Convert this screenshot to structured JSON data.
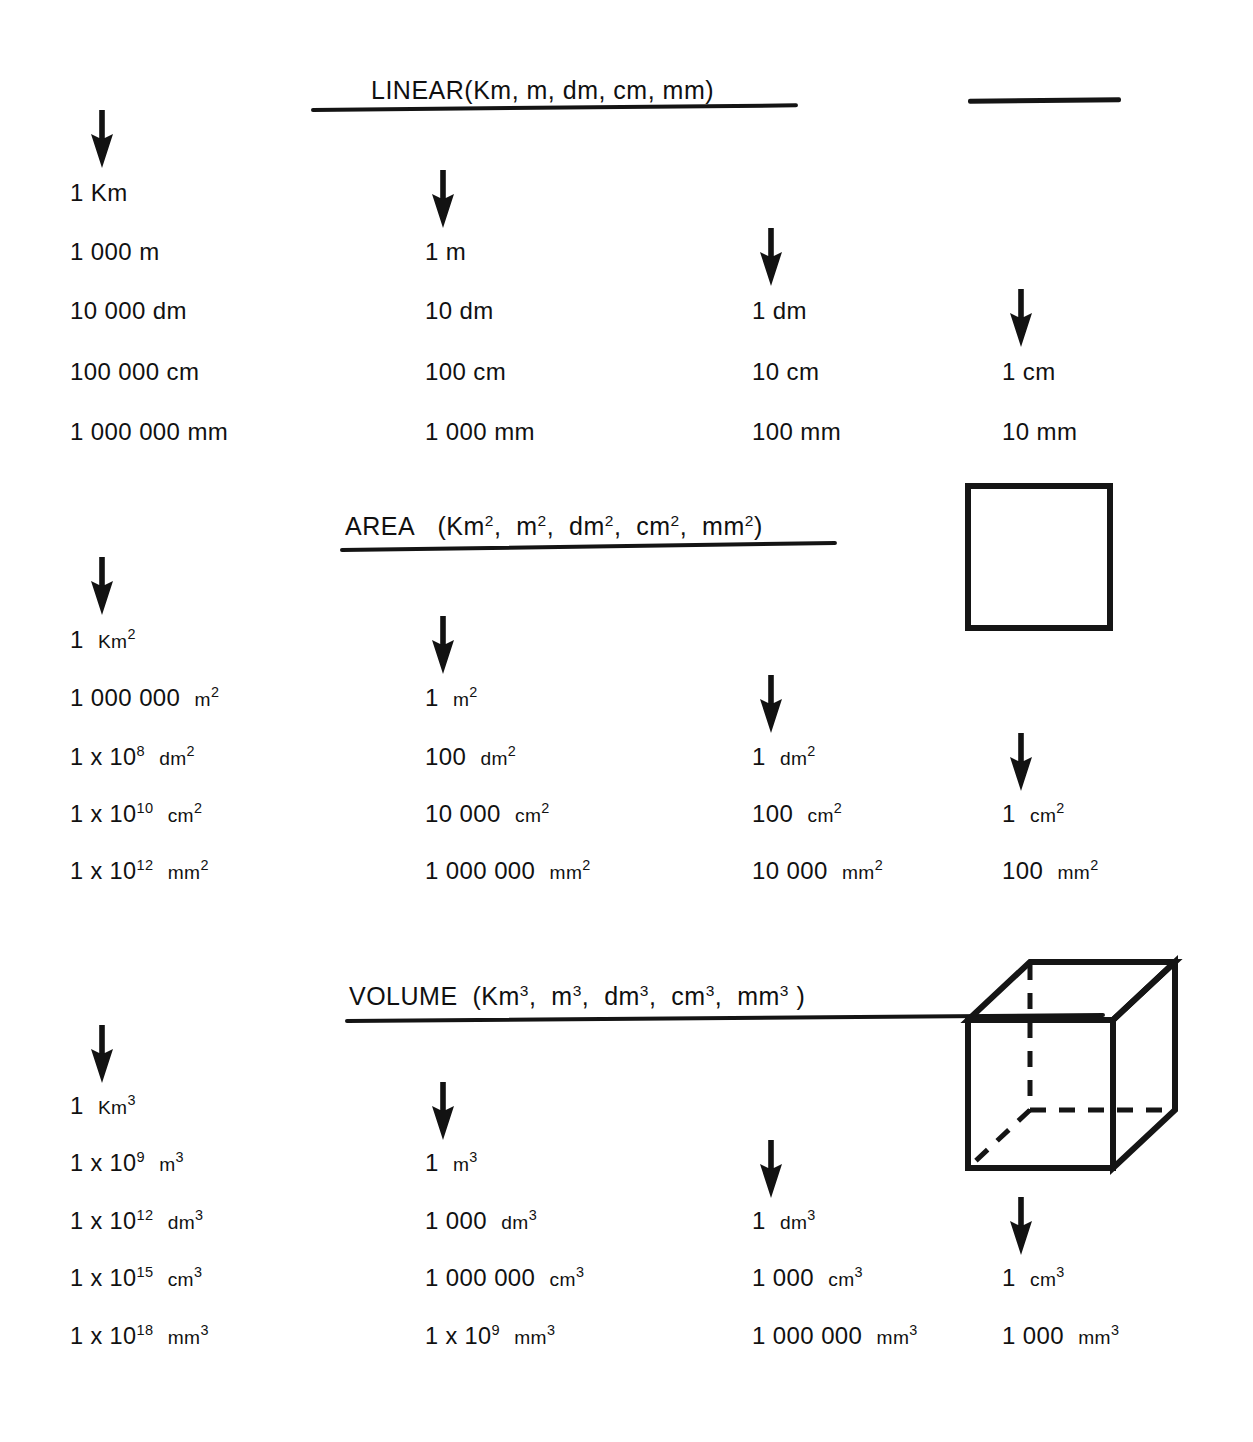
{
  "document": {
    "title": "Metric Units Conversion Chart",
    "background": "#ffffff",
    "ink": "#111111"
  },
  "sections": [
    {
      "id": "linear",
      "name": "LINEAR",
      "units_list": "(Km,  m,  dm,  cm,  mm)",
      "title_full": "LINEAR (Km, m, dm, cm, mm)",
      "figure": "line-segment",
      "columns": [
        {
          "base": "1 Km",
          "rows": [
            "1 Km",
            "1 000 m",
            "10 000 dm",
            "100 000 cm",
            "1 000 000 mm"
          ]
        },
        {
          "base": "1 m",
          "rows": [
            "1 m",
            "10 dm",
            "100 cm",
            "1 000 mm"
          ]
        },
        {
          "base": "1 dm",
          "rows": [
            "1 dm",
            "10 cm",
            "100 mm"
          ]
        },
        {
          "base": "1 cm",
          "rows": [
            "1 cm",
            "10 mm"
          ]
        }
      ]
    },
    {
      "id": "area",
      "name": "AREA",
      "units_list": "(Km2,  m2,  dm2,  cm2,  mm2)",
      "title_full": "AREA (Km², m², dm², cm², mm²)",
      "figure": "square",
      "columns": [
        {
          "base": "1 Km2",
          "rows": [
            "1 Km2",
            "1 000 000 m2",
            "1 x 108 dm2",
            "1 x 1010 cm2",
            "1 x 1012 mm2"
          ]
        },
        {
          "base": "1 m2",
          "rows": [
            "1 m2",
            "100 dm2",
            "10 000 cm2",
            "1 000 000 mm2"
          ]
        },
        {
          "base": "1 dm2",
          "rows": [
            "1 dm2",
            "100 cm2",
            "10 000 mm2"
          ]
        },
        {
          "base": "1 cm2",
          "rows": [
            "1 cm2",
            "100 mm2"
          ]
        }
      ]
    },
    {
      "id": "volume",
      "name": "VOLUME",
      "units_list": "(Km3,  m3,  dm3,  cm3,  mm3 )",
      "title_full": "VOLUME (Km³, m³, dm³, cm³, mm³ )",
      "figure": "cube",
      "columns": [
        {
          "base": "1 Km3",
          "rows": [
            "1 Km3",
            "1 x 109 m3",
            "1 x 1012 dm3",
            "1 x 1015 cm3",
            "1 x 1018 mm3"
          ]
        },
        {
          "base": "1 m3",
          "rows": [
            "1 m3",
            "1 000 dm3",
            "1 000 000 cm3",
            "1 x 109 mm3"
          ]
        },
        {
          "base": "1 dm3",
          "rows": [
            "1 dm3",
            "1 000 cm3",
            "1 000 000 mm3"
          ]
        },
        {
          "base": "1 cm3",
          "rows": [
            "1 cm3",
            "1 000 mm3"
          ]
        }
      ]
    }
  ],
  "linear": {
    "title_name": "LINEAR",
    "title_units": "(Km,  m,  dm,  cm,  mm)",
    "c1": {
      "r1": "1  Km",
      "r2": "1  000  m",
      "r3": "10  000  dm",
      "r4": "100  000  cm",
      "r5": "1  000  000  mm"
    },
    "c2": {
      "r1": "1  m",
      "r2": "10  dm",
      "r3": "100  cm",
      "r4": "1  000  mm"
    },
    "c3": {
      "r1": "1  dm",
      "r2": "10  cm",
      "r3": "100  mm"
    },
    "c4": {
      "r1": "1  cm",
      "r2": "10  mm"
    }
  },
  "area": {
    "title_name": "AREA",
    "c1": {
      "r1_num": "1",
      "r1_unit": "Km",
      "r1_exp": "2",
      "r2_num": "1  000  000",
      "r2_unit": "m",
      "r2_exp": "2",
      "r3_coef": "1  x  10",
      "r3_pow": "8",
      "r3_unit": "dm",
      "r3_exp": "2",
      "r4_coef": "1  x  10",
      "r4_pow": "10",
      "r4_unit": "cm",
      "r4_exp": "2",
      "r5_coef": "1  x  10",
      "r5_pow": "12",
      "r5_unit": "mm",
      "r5_exp": "2"
    },
    "c2": {
      "r1_num": "1",
      "r1_unit": "m",
      "r1_exp": "2",
      "r2_num": "100",
      "r2_unit": "dm",
      "r2_exp": "2",
      "r3_num": "10  000",
      "r3_unit": "cm",
      "r3_exp": "2",
      "r4_num": "1  000  000",
      "r4_unit": "mm",
      "r4_exp": "2"
    },
    "c3": {
      "r1_num": "1",
      "r1_unit": "dm",
      "r1_exp": "2",
      "r2_num": "100",
      "r2_unit": "cm",
      "r2_exp": "2",
      "r3_num": "10  000",
      "r3_unit": "mm",
      "r3_exp": "2"
    },
    "c4": {
      "r1_num": "1",
      "r1_unit": "cm",
      "r1_exp": "2",
      "r2_num": "100",
      "r2_unit": "mm",
      "r2_exp": "2"
    }
  },
  "volume": {
    "title_name": "VOLUME",
    "c1": {
      "r1_num": "1",
      "r1_unit": "Km",
      "r1_exp": "3",
      "r2_coef": "1  x  10",
      "r2_pow": "9",
      "r2_unit": "m",
      "r2_exp": "3",
      "r3_coef": "1  x  10",
      "r3_pow": "12",
      "r3_unit": "dm",
      "r3_exp": "3",
      "r4_coef": "1  x  10",
      "r4_pow": "15",
      "r4_unit": "cm",
      "r4_exp": "3",
      "r5_coef": "1  x  10",
      "r5_pow": "18",
      "r5_unit": "mm",
      "r5_exp": "3"
    },
    "c2": {
      "r1_num": "1",
      "r1_unit": "m",
      "r1_exp": "3",
      "r2_num": "1  000",
      "r2_unit": "dm",
      "r2_exp": "3",
      "r3_num": "1  000  000",
      "r3_unit": "cm",
      "r3_exp": "3",
      "r4_coef": "1  x  10",
      "r4_pow": "9",
      "r4_unit": "mm",
      "r4_exp": "3"
    },
    "c3": {
      "r1_num": "1",
      "r1_unit": "dm",
      "r1_exp": "3",
      "r2_num": "1  000",
      "r2_unit": "cm",
      "r2_exp": "3",
      "r3_num": "1  000  000",
      "r3_unit": "mm",
      "r3_exp": "3"
    },
    "c4": {
      "r1_num": "1",
      "r1_unit": "cm",
      "r1_exp": "3",
      "r2_num": "1  000",
      "r2_unit": "mm",
      "r2_exp": "3"
    }
  },
  "title_parts": {
    "open_paren": "(",
    "comma": ",",
    "close_paren": ")",
    "km": "Km",
    "m": "m",
    "dm": "dm",
    "cm": "cm",
    "mm": "mm",
    "exp2": "2",
    "exp3": "3"
  },
  "figures": {
    "line_label": "line-segment-1cm",
    "square_label": "square-1cm2",
    "cube_label": "cube-1cm3"
  }
}
